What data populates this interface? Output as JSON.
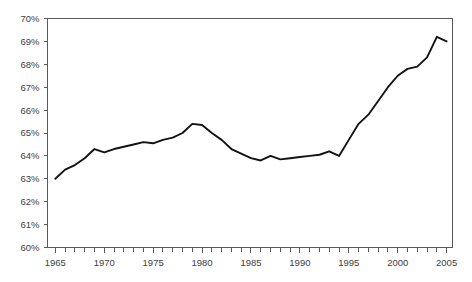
{
  "chart_data": {
    "type": "line",
    "title": "",
    "subtitle": "",
    "xlabel": "",
    "ylabel": "",
    "xlim": [
      1964.2,
      2005.6
    ],
    "ylim": [
      60,
      70
    ],
    "grid": false,
    "legend": null,
    "y_tick_labels": [
      "70%",
      "69%",
      "68%",
      "67%",
      "66%",
      "65%",
      "64%",
      "63%",
      "62%",
      "61%",
      "60%"
    ],
    "y_ticks": [
      70,
      69,
      68,
      67,
      66,
      65,
      64,
      63,
      62,
      61,
      60
    ],
    "x_tick_labels": [
      "1965",
      "1970",
      "1975",
      "1980",
      "1985",
      "1990",
      "1995",
      "2000",
      "2005"
    ],
    "x_major_ticks": [
      1965,
      1970,
      1975,
      1980,
      1985,
      1990,
      1995,
      2000,
      2005
    ],
    "x_minor_tick_start": 1965,
    "x_minor_tick_end": 2005,
    "x_minor_tick_step": 1,
    "series": [
      {
        "name": "rate",
        "color": "#121212",
        "x": [
          1965,
          1966,
          1967,
          1968,
          1969,
          1970,
          1971,
          1972,
          1973,
          1974,
          1975,
          1976,
          1977,
          1978,
          1979,
          1980,
          1981,
          1982,
          1983,
          1984,
          1985,
          1986,
          1987,
          1988,
          1989,
          1990,
          1991,
          1992,
          1993,
          1994,
          1995,
          1996,
          1997,
          1998,
          1999,
          2000,
          2001,
          2002,
          2003,
          2004,
          2005
        ],
        "values": [
          63.0,
          63.4,
          63.6,
          63.9,
          64.3,
          64.15,
          64.3,
          64.4,
          64.5,
          64.6,
          64.55,
          64.7,
          64.8,
          65.0,
          65.4,
          65.35,
          65.0,
          64.7,
          64.3,
          64.1,
          63.9,
          63.8,
          64.0,
          63.85,
          63.9,
          63.95,
          64.0,
          64.05,
          64.2,
          64.0,
          64.7,
          65.4,
          65.8,
          66.4,
          67.0,
          67.5,
          67.8,
          67.9,
          68.3,
          69.2,
          69.0
        ]
      }
    ]
  },
  "axes": {
    "y_axis_name": "percent-axis",
    "x_axis_name": "year-axis"
  }
}
